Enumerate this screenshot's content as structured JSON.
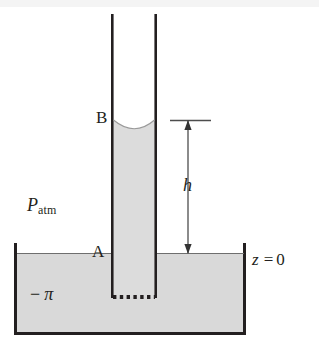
{
  "figure": {
    "labels": {
      "point_b": "B",
      "point_a": "A",
      "height": "h",
      "pressure_atm_main": "P",
      "pressure_atm_sub": "atm",
      "minus_sign": "−",
      "pi_symbol": "π",
      "datum_var": "z",
      "datum_equals": "=",
      "datum_value": "0"
    },
    "colors": {
      "ink": "#231f20",
      "liquid_fill": "#d9d9d9",
      "liquid_fill_tube": "#dcdcdc",
      "background": "#ffffff",
      "arrow": "#4d4d4d"
    },
    "geometry": {
      "tube_left_x": 112,
      "tube_right_x": 156,
      "tube_top_y": 14,
      "tube_bottom_y": 297,
      "meniscus_y": 120,
      "reservoir_left_x": 14,
      "reservoir_right_x": 245,
      "reservoir_surface_y": 253,
      "reservoir_bottom_y": 334,
      "dimension_line_x": 188,
      "dimension_top_y": 121,
      "dimension_bottom_y": 253,
      "reference_tick_left_x": 170,
      "reference_tick_right_x": 211
    }
  }
}
